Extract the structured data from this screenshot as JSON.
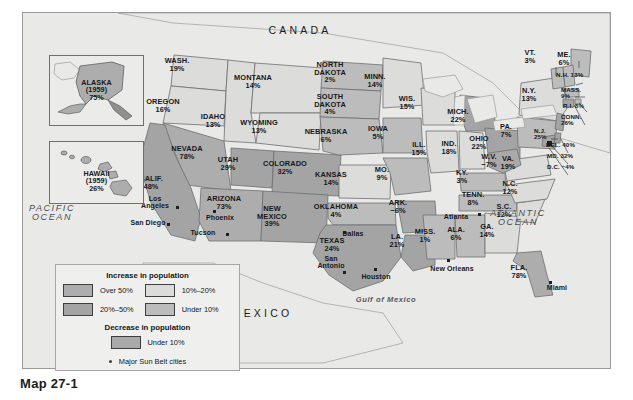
{
  "figure": {
    "caption": "Map 27-1",
    "country_labels": [
      {
        "name": "canada",
        "text": "CANADA",
        "x": 300,
        "y": 24
      },
      {
        "name": "mexico",
        "text": "MEXICO",
        "x": 262,
        "y": 307
      }
    ],
    "water_labels": [
      {
        "name": "pacific-ocean",
        "text": "PACIFIC\nOCEAN",
        "x": 52,
        "y": 203
      },
      {
        "name": "atlantic-ocean",
        "text": "ATLANTIC\nOCEAN",
        "x": 518,
        "y": 208
      },
      {
        "name": "gulf-of-mexico",
        "text": "Gulf of Mexico",
        "x": 386,
        "y": 295
      }
    ]
  },
  "insets": [
    {
      "name": "alaska",
      "title": "ALASKA",
      "year": "(1959)",
      "value": "75%"
    },
    {
      "name": "hawaii",
      "title": "HAWAII",
      "year": "(1959)",
      "value": "26%"
    }
  ],
  "legend": {
    "increase_title": "Increase in population",
    "decrease_title": "Decrease in population",
    "increase_items": [
      {
        "label": "Over 50%",
        "swatch": "f-over50"
      },
      {
        "label": "20%–50%",
        "swatch": "f-20to50"
      },
      {
        "label": "10%–20%",
        "swatch": "f-10to20"
      },
      {
        "label": "Under 10%",
        "swatch": "f-under10"
      }
    ],
    "decrease_items": [
      {
        "label": "Under 10%",
        "swatch": "f-dec"
      }
    ],
    "cities_label": "Major Sun Belt cities"
  },
  "colors": {
    "over50": "#adadad",
    "pct20to50": "#a4a4a4",
    "pct10to20": "#dcdcda",
    "under10": "#bcbcbc",
    "decrease": "#a9a9a9",
    "background": "#e9e9e7",
    "outline": "#6d6f71"
  },
  "cities": [
    {
      "name": "los-angeles",
      "label": "Los\nAngeles",
      "x": 155,
      "y": 194,
      "dot_x": 176,
      "dot_y": 205
    },
    {
      "name": "san-diego",
      "label": "San Diego",
      "x": 148,
      "y": 218,
      "dot_x": 167,
      "dot_y": 222
    },
    {
      "name": "tucson",
      "label": "Tucson",
      "x": 203,
      "y": 228,
      "dot_x": 226,
      "dot_y": 232
    },
    {
      "name": "phoenix",
      "label": "Phoenix",
      "x": 220,
      "y": 213,
      "dot_x": 213,
      "dot_y": 209
    },
    {
      "name": "dallas",
      "label": "Dallas",
      "x": 353,
      "y": 229,
      "dot_x": 343,
      "dot_y": 230
    },
    {
      "name": "san-antonio",
      "label": "San\nAntonio",
      "x": 331,
      "y": 254,
      "dot_x": 343,
      "dot_y": 270
    },
    {
      "name": "houston",
      "label": "Houston",
      "x": 376,
      "y": 272,
      "dot_x": 374,
      "dot_y": 267
    },
    {
      "name": "new-orleans",
      "label": "New Orleans",
      "x": 452,
      "y": 264,
      "dot_x": 447,
      "dot_y": 258
    },
    {
      "name": "atlanta",
      "label": "Atlanta",
      "x": 456,
      "y": 212,
      "dot_x": 478,
      "dot_y": 212
    },
    {
      "name": "miami",
      "label": "Miami",
      "x": 557,
      "y": 283,
      "dot_x": 549,
      "dot_y": 280
    }
  ],
  "chart_data": {
    "type": "map",
    "unit": "percent",
    "states": [
      {
        "name": "WASH.",
        "value": "19%",
        "class": "pct10to20",
        "x": 177,
        "y": 56
      },
      {
        "name": "OREGON",
        "value": "16%",
        "class": "pct10to20",
        "x": 163,
        "y": 97
      },
      {
        "name": "IDAHO",
        "value": "13%",
        "class": "pct10to20",
        "x": 213,
        "y": 112
      },
      {
        "name": "MONTANA",
        "value": "14%",
        "class": "pct10to20",
        "x": 253,
        "y": 73
      },
      {
        "name": "WYOMING",
        "value": "13%",
        "class": "pct10to20",
        "x": 259,
        "y": 118
      },
      {
        "name": "NEVADA",
        "value": "78%",
        "class": "over50",
        "x": 187,
        "y": 144
      },
      {
        "name": "UTAH",
        "value": "29%",
        "class": "pct20to50",
        "x": 228,
        "y": 155
      },
      {
        "name": "CALIF.",
        "value": "48%",
        "class": "pct20to50",
        "x": 151,
        "y": 174
      },
      {
        "name": "ARIZONA",
        "value": "73%",
        "class": "over50",
        "x": 224,
        "y": 194
      },
      {
        "name": "COLORADO",
        "value": "32%",
        "class": "pct20to50",
        "x": 285,
        "y": 159
      },
      {
        "name": "NEW\nMEXICO",
        "value": "39%",
        "class": "pct20to50",
        "x": 272,
        "y": 204
      },
      {
        "name": "NORTH\nDAKOTA",
        "value": "2%",
        "class": "under10",
        "x": 330,
        "y": 60
      },
      {
        "name": "SOUTH\nDAKOTA",
        "value": "4%",
        "class": "under10",
        "x": 330,
        "y": 92
      },
      {
        "name": "NEBRASKA",
        "value": "6%",
        "class": "under10",
        "x": 326,
        "y": 127
      },
      {
        "name": "KANSAS",
        "value": "14%",
        "class": "pct10to20",
        "x": 331,
        "y": 170
      },
      {
        "name": "OKLAHOMA",
        "value": "4%",
        "class": "under10",
        "x": 336,
        "y": 202
      },
      {
        "name": "TEXAS",
        "value": "24%",
        "class": "pct20to50",
        "x": 332,
        "y": 236
      },
      {
        "name": "MINN.",
        "value": "14%",
        "class": "pct10to20",
        "x": 375,
        "y": 72
      },
      {
        "name": "IOWA",
        "value": "5%",
        "class": "under10",
        "x": 378,
        "y": 124
      },
      {
        "name": "MO.",
        "value": "9%",
        "class": "under10",
        "x": 382,
        "y": 165
      },
      {
        "name": "ARK.",
        "value": "−6%",
        "class": "decrease",
        "x": 398,
        "y": 198
      },
      {
        "name": "LA.",
        "value": "21%",
        "class": "pct20to50",
        "x": 397,
        "y": 232
      },
      {
        "name": "WIS.",
        "value": "15%",
        "class": "pct10to20",
        "x": 407,
        "y": 94
      },
      {
        "name": "ILL.",
        "value": "15%",
        "class": "pct10to20",
        "x": 419,
        "y": 140
      },
      {
        "name": "IND.",
        "value": "18%",
        "class": "pct10to20",
        "x": 449,
        "y": 139
      },
      {
        "name": "MICH.",
        "value": "22%",
        "class": "pct20to50",
        "x": 458,
        "y": 107
      },
      {
        "name": "OHIO",
        "value": "22%",
        "class": "pct20to50",
        "x": 479,
        "y": 134
      },
      {
        "name": "KY.",
        "value": "3%",
        "class": "under10",
        "x": 462,
        "y": 168
      },
      {
        "name": "TENN.",
        "value": "8%",
        "class": "under10",
        "x": 473,
        "y": 190
      },
      {
        "name": "MISS.",
        "value": "1%",
        "class": "under10",
        "x": 425,
        "y": 227
      },
      {
        "name": "ALA.",
        "value": "6%",
        "class": "under10",
        "x": 456,
        "y": 225
      },
      {
        "name": "GA.",
        "value": "14%",
        "class": "pct10to20",
        "x": 487,
        "y": 222
      },
      {
        "name": "FLA.",
        "value": "78%",
        "class": "over50",
        "x": 519,
        "y": 263
      },
      {
        "name": "S.C.",
        "value": "12%",
        "class": "pct10to20",
        "x": 504,
        "y": 202
      },
      {
        "name": "N.C.",
        "value": "12%",
        "class": "pct10to20",
        "x": 510,
        "y": 179
      },
      {
        "name": "VA.",
        "value": "19%",
        "class": "pct10to20",
        "x": 508,
        "y": 154
      },
      {
        "name": "W.V.",
        "value": "−7%",
        "class": "decrease",
        "x": 489,
        "y": 152
      },
      {
        "name": "PA.",
        "value": "7%",
        "class": "under10",
        "x": 506,
        "y": 122
      },
      {
        "name": "N.Y.",
        "value": "13%",
        "class": "pct10to20",
        "x": 529,
        "y": 86
      },
      {
        "name": "VT.",
        "value": "3%",
        "class": "under10",
        "x": 530,
        "y": 48
      },
      {
        "name": "ME.",
        "value": "6%",
        "class": "under10",
        "x": 564,
        "y": 50
      }
    ],
    "leader_states": [
      {
        "name": "N.H.",
        "value": "13%",
        "x": 556,
        "y": 71
      },
      {
        "name": "MASS.",
        "value": "9%",
        "x": 561,
        "y": 86
      },
      {
        "name": "R.I.",
        "value": "8%",
        "x": 563,
        "y": 102
      },
      {
        "name": "CONN.",
        "value": "26%",
        "x": 561,
        "y": 113
      },
      {
        "name": "N.J.",
        "value": "25%",
        "x": 534,
        "y": 127
      },
      {
        "name": "DEL.",
        "value": "40%",
        "x": 546,
        "y": 141
      },
      {
        "name": "MD.",
        "value": "32%",
        "x": 547,
        "y": 152
      },
      {
        "name": "D.C.",
        "value": "−4%",
        "x": 547,
        "y": 163
      }
    ]
  }
}
